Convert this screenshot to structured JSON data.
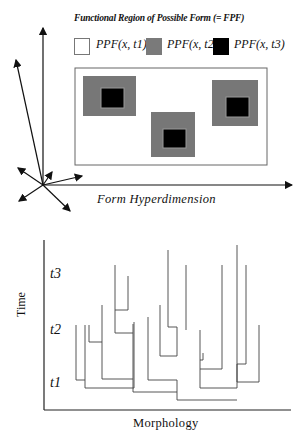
{
  "top_diagram": {
    "title": "Functional Region of Possible Form (= FPF)",
    "legend": [
      {
        "label": "PPF(x, t1)",
        "color": "#ffffff"
      },
      {
        "label": "PPF(x, t2)",
        "color": "#7a7a7a"
      },
      {
        "label": "PPF(x, t3)",
        "color": "#000000"
      }
    ],
    "x_axis_label": "Form Hyperdimension"
  },
  "bottom_diagram": {
    "y_axis_label": "Time",
    "x_axis_label": "Morphology",
    "time_labels": [
      "t3",
      "t2",
      "t1"
    ]
  }
}
